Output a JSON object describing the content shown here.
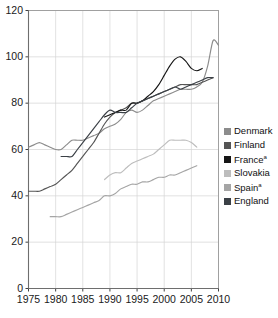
{
  "chart_data": {
    "type": "line",
    "title": "",
    "xlabel": "",
    "ylabel": "",
    "xlim": [
      1975,
      2010
    ],
    "ylim": [
      0,
      120
    ],
    "xticks": [
      1975,
      1980,
      1985,
      1990,
      1995,
      2000,
      2005,
      2010
    ],
    "yticks": [
      0,
      20,
      40,
      60,
      80,
      100,
      120
    ],
    "grid": true,
    "legend_position": "right",
    "series": [
      {
        "name": "Denmark",
        "color": "#8c8c8c",
        "x": [
          1975,
          1976,
          1977,
          1978,
          1979,
          1980,
          1981,
          1982,
          1983,
          1984,
          1985,
          1986,
          1987,
          1988,
          1989,
          1990,
          1991,
          1992,
          1993,
          1994,
          1995,
          1996,
          1997,
          1998,
          1999,
          2000,
          2001,
          2002,
          2003,
          2004,
          2005,
          2006,
          2007,
          2008,
          2009,
          2010
        ],
        "y": [
          61,
          62,
          63,
          62,
          61,
          60,
          60,
          62,
          64,
          64,
          64,
          65,
          66,
          67,
          69,
          70,
          71,
          73,
          76,
          77,
          76,
          77,
          79,
          81,
          82,
          83,
          84,
          85,
          86,
          86,
          86,
          87,
          89,
          96,
          107,
          105
        ]
      },
      {
        "name": "Finland",
        "color": "#555555",
        "x": [
          1975,
          1976,
          1977,
          1978,
          1979,
          1980,
          1981,
          1982,
          1983,
          1984,
          1985,
          1986,
          1987,
          1988,
          1989,
          1990,
          1991,
          1992,
          1993,
          1994,
          1995,
          1996,
          1997,
          1998,
          1999,
          2000,
          2001,
          2002,
          2003,
          2004,
          2005,
          2006,
          2007,
          2008,
          2009
        ],
        "y": [
          42,
          42,
          42,
          43,
          44,
          45,
          47,
          49,
          51,
          54,
          57,
          60,
          63,
          67,
          71,
          74,
          76,
          77,
          78,
          80,
          80,
          81,
          82,
          83,
          84,
          85,
          86,
          87,
          88,
          88,
          88,
          88,
          89,
          90,
          91
        ]
      },
      {
        "name": "France",
        "color": "#161616",
        "x": [
          1989,
          1990,
          1991,
          1992,
          1993,
          1994,
          1995,
          1996,
          1997,
          1998,
          1999,
          2000,
          2001,
          2002,
          2003,
          2004,
          2005,
          2006,
          2007
        ],
        "y": [
          74,
          75,
          76,
          77,
          77,
          80,
          80,
          81,
          83,
          85,
          88,
          92,
          96,
          99,
          100,
          98,
          95,
          94,
          95
        ]
      },
      {
        "name": "Slovakia",
        "color": "#bdbdbd",
        "x": [
          1989,
          1990,
          1991,
          1992,
          1993,
          1994,
          1995,
          1996,
          1997,
          1998,
          1999,
          2000,
          2001,
          2002,
          2003,
          2004,
          2005,
          2006
        ],
        "y": [
          47,
          49,
          50,
          50,
          52,
          54,
          55,
          56,
          57,
          58,
          60,
          62,
          64,
          64,
          64,
          64,
          63,
          61
        ]
      },
      {
        "name": "Spain",
        "color": "#a5a5a5",
        "x": [
          1979,
          1980,
          1981,
          1982,
          1983,
          1984,
          1985,
          1986,
          1987,
          1988,
          1989,
          1990,
          1991,
          1992,
          1993,
          1994,
          1995,
          1996,
          1997,
          1998,
          1999,
          2000,
          2001,
          2002,
          2003,
          2004,
          2005,
          2006
        ],
        "y": [
          31,
          31,
          31,
          32,
          33,
          34,
          35,
          36,
          37,
          38,
          40,
          40,
          41,
          43,
          44,
          45,
          45,
          46,
          46,
          47,
          48,
          48,
          49,
          49,
          50,
          51,
          52,
          53
        ]
      },
      {
        "name": "England",
        "color": "#3b4046",
        "x": [
          1981,
          1982,
          1983,
          1984,
          1985,
          1986,
          1987,
          1988,
          1989,
          1990,
          1991,
          1992,
          1993,
          1994,
          1995,
          1996,
          1997,
          1998,
          1999,
          2000,
          2001,
          2002,
          2003,
          2004,
          2005,
          2006,
          2007,
          2008,
          2009
        ],
        "y": [
          57,
          57,
          57,
          60,
          63,
          66,
          69,
          72,
          75,
          77,
          76,
          76,
          76,
          78,
          80,
          81,
          82,
          83,
          84,
          85,
          86,
          87,
          86,
          87,
          88,
          89,
          90,
          91,
          91
        ]
      }
    ]
  },
  "legend": {
    "items": [
      {
        "label": "Denmark",
        "sup": "",
        "color": "#8c8c8c"
      },
      {
        "label": "Finland",
        "sup": "",
        "color": "#555555"
      },
      {
        "label": "France",
        "sup": "a",
        "color": "#161616"
      },
      {
        "label": "Slovakia",
        "sup": "",
        "color": "#bdbdbd"
      },
      {
        "label": "Spain",
        "sup": "a",
        "color": "#a5a5a5"
      },
      {
        "label": "England",
        "sup": "",
        "color": "#3b4046"
      }
    ]
  },
  "axes": {
    "y_tick_labels": [
      "120",
      "100",
      "80",
      "60",
      "40",
      "20",
      "0"
    ],
    "x_tick_labels": [
      "1975",
      "1980",
      "1985",
      "1990",
      "1995",
      "2000",
      "2005",
      "2010"
    ]
  }
}
